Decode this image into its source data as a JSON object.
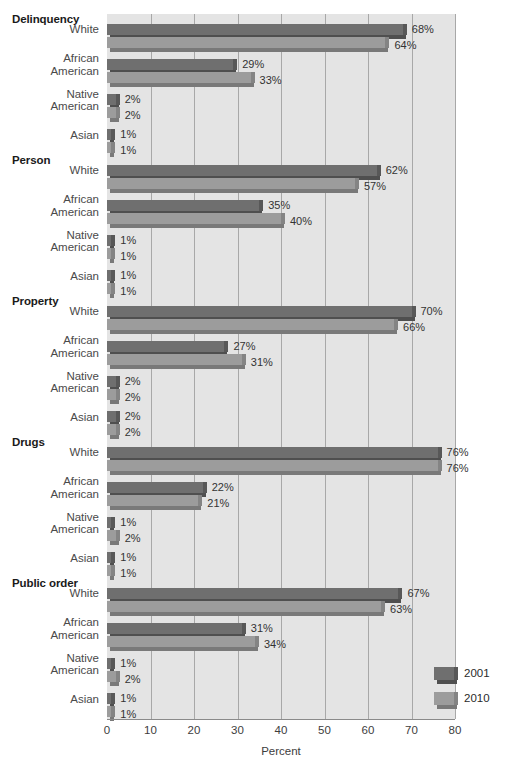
{
  "chart_data": {
    "type": "bar",
    "orientation": "horizontal",
    "title": "",
    "xlabel": "Percent",
    "ylabel": "",
    "xlim": [
      0,
      80
    ],
    "xticks": [
      0,
      10,
      20,
      30,
      40,
      50,
      60,
      70,
      80
    ],
    "grid": "vertical",
    "legend_position": "bottom-right",
    "value_suffix": "%",
    "series": [
      {
        "name": "2001",
        "color": "#6f6f6f"
      },
      {
        "name": "2010",
        "color": "#9c9c9c"
      }
    ],
    "groups": [
      {
        "name": "Delinquency",
        "categories": [
          "White",
          "African American",
          "Native American",
          "Asian"
        ],
        "values_2001": [
          68,
          29,
          2,
          1
        ],
        "values_2010": [
          64,
          33,
          2,
          1
        ],
        "labels_2001": [
          "68%",
          "29%",
          "2%",
          "1%"
        ],
        "labels_2010": [
          "64%",
          "33%",
          "2%",
          "1%"
        ]
      },
      {
        "name": "Person",
        "categories": [
          "White",
          "African American",
          "Native American",
          "Asian"
        ],
        "values_2001": [
          62,
          35,
          1,
          1
        ],
        "values_2010": [
          57,
          40,
          1,
          1
        ],
        "labels_2001": [
          "62%",
          "35%",
          "1%",
          "1%"
        ],
        "labels_2010": [
          "57%",
          "40%",
          "1%",
          "1%"
        ]
      },
      {
        "name": "Property",
        "categories": [
          "White",
          "African American",
          "Native American",
          "Asian"
        ],
        "values_2001": [
          70,
          27,
          2,
          2
        ],
        "values_2010": [
          66,
          31,
          2,
          2
        ],
        "labels_2001": [
          "70%",
          "27%",
          "2%",
          "2%"
        ],
        "labels_2010": [
          "66%",
          "31%",
          "2%",
          "2%"
        ]
      },
      {
        "name": "Drugs",
        "categories": [
          "White",
          "African American",
          "Native American",
          "Asian"
        ],
        "values_2001": [
          76,
          22,
          1,
          1
        ],
        "values_2010": [
          76,
          21,
          2,
          1
        ],
        "labels_2001": [
          "76%",
          "22%",
          "1%",
          "1%"
        ],
        "labels_2010": [
          "76%",
          "21%",
          "2%",
          "1%"
        ]
      },
      {
        "name": "Public order",
        "categories": [
          "White",
          "African American",
          "Native American",
          "Asian"
        ],
        "values_2001": [
          67,
          31,
          1,
          1
        ],
        "values_2010": [
          63,
          34,
          2,
          1
        ],
        "labels_2001": [
          "67%",
          "31%",
          "1%",
          "1%"
        ],
        "labels_2010": [
          "63%",
          "34%",
          "2%",
          "1%"
        ]
      }
    ]
  },
  "axis": {
    "x_title": "Percent",
    "tick_labels": [
      "0",
      "10",
      "20",
      "30",
      "40",
      "50",
      "60",
      "70",
      "80"
    ]
  },
  "legend": {
    "items": [
      {
        "label": "2001"
      },
      {
        "label": "2010"
      }
    ]
  }
}
